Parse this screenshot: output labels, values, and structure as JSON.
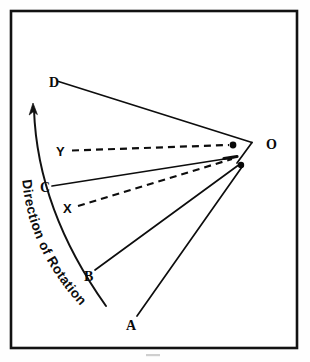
{
  "figure": {
    "background_color": "#ffffff",
    "ink_color": "#0d0d0d",
    "frame": {
      "name": "outer-border",
      "x": 11,
      "y": 11,
      "width": 286,
      "height": 337,
      "stroke_width": 2.6
    },
    "rotation_caption": {
      "text": "Direction of Rotation",
      "orientation": "along-arc-upward"
    },
    "labels": {
      "A": "A",
      "B": "B",
      "C": "C",
      "D": "D",
      "X": "X",
      "Y": "Y",
      "O": "O"
    },
    "points": [
      {
        "id": "A",
        "label": "A",
        "x": 132,
        "y": 322,
        "label_x": 127,
        "label_y": 329,
        "line_style": "solid",
        "target": "lower-pivot"
      },
      {
        "id": "B",
        "label": "B",
        "x": 88,
        "y": 274,
        "label_x": 85,
        "label_y": 281,
        "line_style": "solid",
        "target": "lower-pivot"
      },
      {
        "id": "C",
        "label": "C",
        "x": 45,
        "y": 186,
        "label_x": 41,
        "label_y": 192,
        "line_style": "solid",
        "target": "upper-pivot-edge"
      },
      {
        "id": "D",
        "label": "D",
        "x": 58,
        "y": 81,
        "label_x": 49,
        "label_y": 87,
        "line_style": "solid",
        "target": "vertex"
      },
      {
        "id": "X",
        "label": "X",
        "x": 69,
        "y": 207,
        "label_x": 64,
        "label_y": 213,
        "line_style": "dashed",
        "target": "upper-pivot-edge"
      },
      {
        "id": "Y",
        "label": "Y",
        "x": 63,
        "y": 150,
        "label_x": 58,
        "label_y": 156,
        "line_style": "dashed",
        "target": "upper-pivot"
      },
      {
        "id": "O",
        "label": "O",
        "x": 252,
        "y": 143,
        "label_x": 267,
        "label_y": 148,
        "line_style": "none",
        "target": "vertex-label"
      }
    ],
    "pivot_dots": [
      {
        "id": "upper-pivot",
        "x": 233,
        "y": 145,
        "r": 3.4
      },
      {
        "id": "lower-pivot",
        "x": 241,
        "y": 165,
        "r": 3.2
      }
    ],
    "vertex": {
      "id": "O-vertex",
      "x": 252,
      "y": 143
    },
    "arrow": {
      "id": "rotation-arrow",
      "head_x": 33,
      "head_y": 104,
      "tail_x": 106,
      "tail_y": 306,
      "direction": "counter-clockwise-upward"
    }
  }
}
